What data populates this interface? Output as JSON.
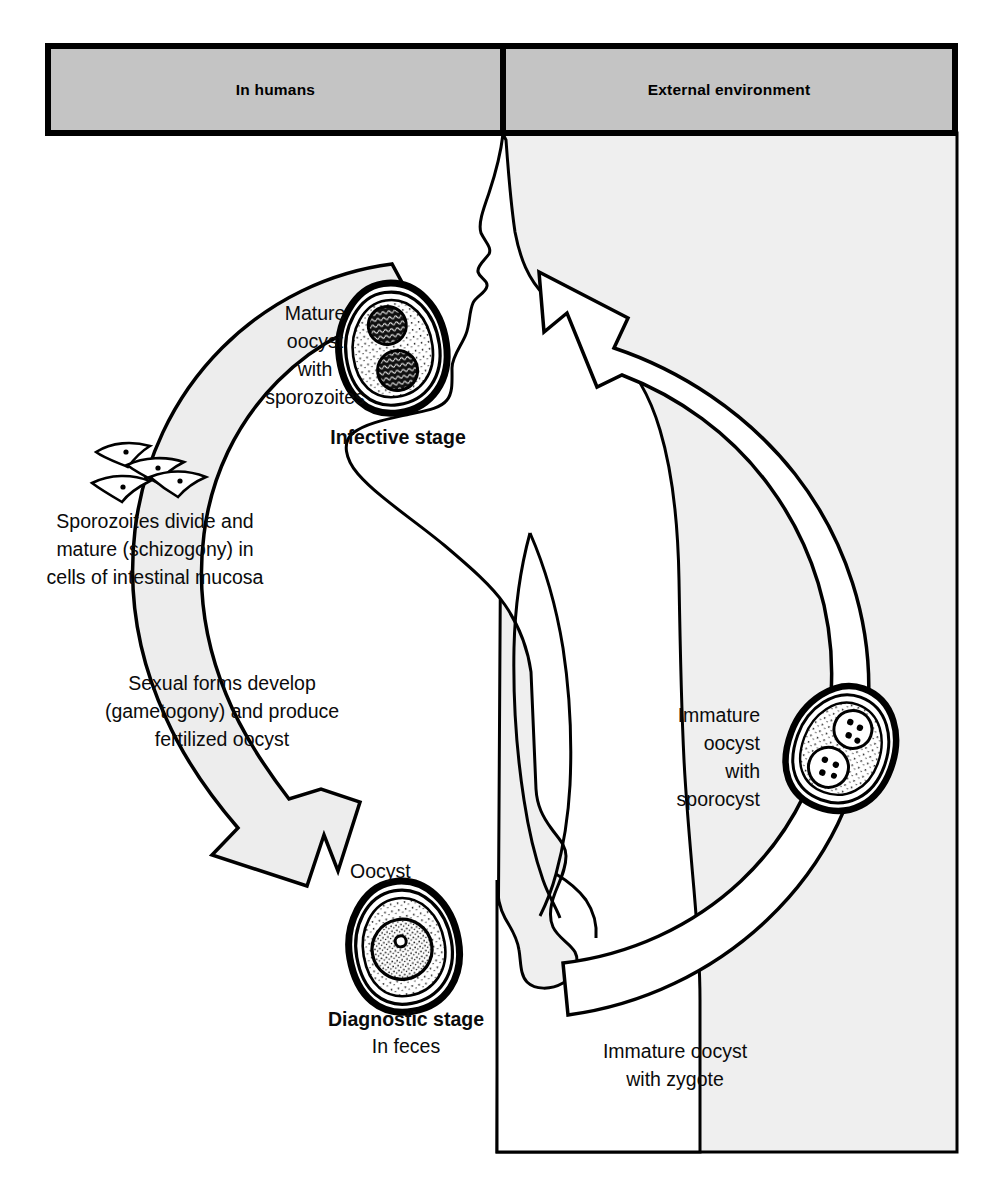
{
  "diagram": {
    "type": "life-cycle-flow-diagram",
    "background_color": "#ffffff",
    "panel_fill_color": "#efefef",
    "banner_fill_color": "#c4c4c4",
    "arrow_fill_left": "#ededed",
    "arrow_fill_right": "#ffffff",
    "outline_color": "#000000"
  },
  "banners": [
    {
      "id": "in-humans",
      "label": "In humans"
    },
    {
      "id": "external-environment",
      "label": "External environment"
    }
  ],
  "labels": {
    "mature_oocyst": {
      "lines": [
        "Mature",
        "oocyst",
        "with",
        "sporozoites"
      ],
      "align": "center"
    },
    "infective_stage": {
      "text": "Infective stage",
      "bold": true
    },
    "schizogony": {
      "lines": [
        "Sporozoites divide and",
        "mature (schizogony) in",
        "cells of intestinal mucosa"
      ],
      "align": "center"
    },
    "gametogony": {
      "lines": [
        "Sexual forms develop",
        "(gametogony) and produce",
        "fertilized oocyst"
      ],
      "align": "center"
    },
    "oocyst": {
      "text": "Oocyst"
    },
    "diagnostic_stage": {
      "text": "Diagnostic stage",
      "bold": true
    },
    "in_feces": {
      "text": "In feces"
    },
    "immature_oocyst_sporocyst": {
      "lines": [
        "Immature",
        "oocyst",
        "with",
        "sporocyst"
      ],
      "align": "right"
    },
    "immature_oocyst_zygote": {
      "lines": [
        "Immature oocyst",
        "with zygote"
      ],
      "align": "center"
    }
  },
  "stages": [
    {
      "id": "mature-oocyst",
      "name": "Mature oocyst with sporozoites",
      "role": "Infective stage",
      "location": "In humans",
      "internal_bodies": 2,
      "body_type": "sporocyst-with-sporozoites"
    },
    {
      "id": "sporozoites",
      "name": "Sporozoites released",
      "role": "Excystation in intestine",
      "location": "In humans",
      "count": 4
    },
    {
      "id": "oocyst-feces",
      "name": "Oocyst",
      "role": "Diagnostic stage",
      "location": "In feces",
      "internal_bodies": 1,
      "body_type": "zygote"
    },
    {
      "id": "immature-oocyst-zygote",
      "name": "Immature oocyst with zygote",
      "location": "External environment",
      "internal_bodies": 1,
      "body_type": "zygote"
    },
    {
      "id": "immature-oocyst-sporocyst",
      "name": "Immature oocyst with sporocyst",
      "location": "External environment",
      "internal_bodies": 2,
      "body_type": "sporocyst"
    }
  ],
  "processes": [
    {
      "id": "ingestion",
      "text": "Mature oocyst ingested by human",
      "direction": "external-to-human"
    },
    {
      "id": "schizogony",
      "text": "Sporozoites divide and mature (schizogony) in cells of intestinal mucosa"
    },
    {
      "id": "gametogony",
      "text": "Sexual forms develop (gametogony) and produce fertilized oocyst"
    },
    {
      "id": "sporulation",
      "text": "Oocyst matures in external environment",
      "direction": "human-to-external"
    }
  ]
}
